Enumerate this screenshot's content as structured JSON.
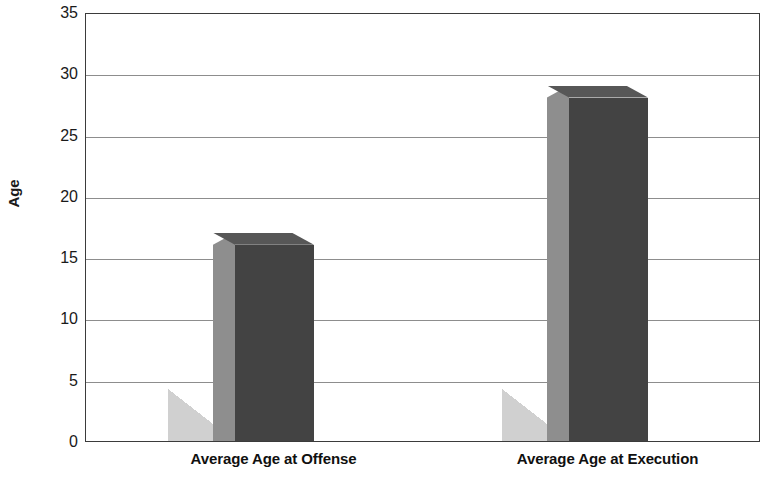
{
  "chart_data": {
    "type": "bar",
    "title": "",
    "subtitle": "",
    "xlabel": "",
    "ylabel": "Age",
    "categories": [
      "Average Age at Offense",
      "Average Age at Execution"
    ],
    "values": [
      17,
      29
    ],
    "series": [
      {
        "name": "Age",
        "values": [
          17,
          29
        ]
      }
    ],
    "ylim": [
      0,
      35
    ],
    "ytick_labels": [
      "0",
      "5",
      "10",
      "15",
      "20",
      "25",
      "30",
      "35"
    ],
    "ytick_values": [
      0,
      5,
      10,
      15,
      20,
      25,
      30,
      35
    ],
    "grid": "horizontal",
    "legend": "none",
    "style": "3d-column",
    "colors": {
      "bar_front": "#434343",
      "bar_side": "#8e8e8e",
      "bar_top": "#575757",
      "shadow": "#d0d0d0",
      "gridline": "#8d8d8d",
      "axis": "#3b3b3b",
      "text": "#101010",
      "background": "#ffffff"
    }
  }
}
